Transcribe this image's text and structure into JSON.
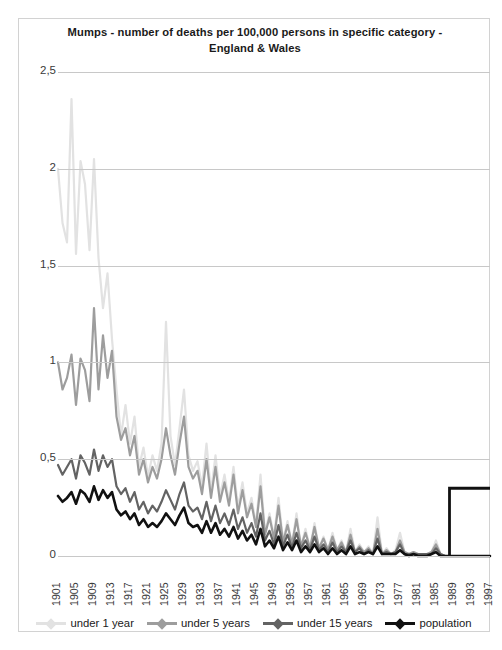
{
  "chart": {
    "title": "Mumps - number of deaths per 100,000  persons in specific category - England & Wales"
  },
  "chart_data": {
    "type": "line",
    "title": "Mumps - number of deaths per 100,000  persons in specific category - England & Wales",
    "xlabel": "",
    "ylabel": "",
    "ylim": [
      0,
      2.5
    ],
    "xlim": [
      1901,
      1997
    ],
    "grid": true,
    "legend_position": "bottom",
    "ytick_labels": [
      "0",
      "0,5",
      "1",
      "1,5",
      "2",
      "2,5"
    ],
    "ytick_values": [
      0,
      0.5,
      1,
      1.5,
      2,
      2.5
    ],
    "xtick_labels": [
      "1901",
      "1905",
      "1909",
      "1913",
      "1917",
      "1921",
      "1925",
      "1929",
      "1933",
      "1937",
      "1941",
      "1945",
      "1949",
      "1953",
      "1957",
      "1961",
      "1965",
      "1969",
      "1973",
      "1977",
      "1981",
      "1985",
      "1989",
      "1993",
      "1997"
    ],
    "colors": {
      "under_1_year": "#e2e2e2",
      "under_5_years": "#9d9d9d",
      "under_15_years": "#636363",
      "population": "#111111",
      "gridline": "#c8c8c8",
      "border": "#d2d2d2",
      "text": "#1a1a1a"
    },
    "x": [
      1901,
      1902,
      1903,
      1904,
      1905,
      1906,
      1907,
      1908,
      1909,
      1910,
      1911,
      1912,
      1913,
      1914,
      1915,
      1916,
      1917,
      1918,
      1919,
      1920,
      1921,
      1922,
      1923,
      1924,
      1925,
      1926,
      1927,
      1928,
      1929,
      1930,
      1931,
      1932,
      1933,
      1934,
      1935,
      1936,
      1937,
      1938,
      1939,
      1940,
      1941,
      1942,
      1943,
      1944,
      1945,
      1946,
      1947,
      1948,
      1949,
      1950,
      1951,
      1952,
      1953,
      1954,
      1955,
      1956,
      1957,
      1958,
      1959,
      1960,
      1961,
      1962,
      1963,
      1964,
      1965,
      1966,
      1967,
      1968,
      1969,
      1970,
      1971,
      1972,
      1973,
      1974,
      1975,
      1976,
      1977,
      1978,
      1979,
      1980,
      1981,
      1982,
      1983,
      1984,
      1985,
      1986,
      1987,
      1988,
      1989,
      1990,
      1991,
      1992,
      1993,
      1994,
      1995,
      1996,
      1997
    ],
    "series": [
      {
        "name": "under 1 year",
        "color": "#e2e2e2",
        "values": [
          2.0,
          1.72,
          1.62,
          2.36,
          1.56,
          2.04,
          1.92,
          1.58,
          2.05,
          1.54,
          1.28,
          1.46,
          1.12,
          0.86,
          0.62,
          0.78,
          0.58,
          0.72,
          0.46,
          0.56,
          0.41,
          0.52,
          0.44,
          0.58,
          1.21,
          0.62,
          0.47,
          0.66,
          0.86,
          0.52,
          0.44,
          0.49,
          0.36,
          0.58,
          0.33,
          0.52,
          0.31,
          0.42,
          0.28,
          0.46,
          0.25,
          0.38,
          0.22,
          0.3,
          0.16,
          0.42,
          0.12,
          0.22,
          0.1,
          0.3,
          0.08,
          0.18,
          0.06,
          0.22,
          0.05,
          0.14,
          0.04,
          0.17,
          0.04,
          0.1,
          0.03,
          0.12,
          0.03,
          0.08,
          0.02,
          0.14,
          0.02,
          0.06,
          0.02,
          0.05,
          0.01,
          0.2,
          0.01,
          0.04,
          0.01,
          0.03,
          0.12,
          0.02,
          0.01,
          0.02,
          0.01,
          0.01,
          0.01,
          0.02,
          0.08,
          0.01,
          0.0,
          0.0,
          0.0,
          0.0,
          0.0,
          0.0,
          0.0,
          0.0,
          0.0,
          0.0,
          0.0
        ]
      },
      {
        "name": "under 5 years",
        "color": "#9d9d9d",
        "values": [
          1.0,
          0.86,
          0.92,
          1.04,
          0.78,
          1.02,
          0.96,
          0.8,
          1.28,
          0.86,
          1.14,
          0.92,
          1.06,
          0.72,
          0.6,
          0.66,
          0.52,
          0.62,
          0.42,
          0.5,
          0.38,
          0.46,
          0.4,
          0.5,
          0.66,
          0.52,
          0.42,
          0.58,
          0.72,
          0.46,
          0.4,
          0.44,
          0.32,
          0.5,
          0.3,
          0.46,
          0.28,
          0.38,
          0.26,
          0.42,
          0.22,
          0.34,
          0.2,
          0.27,
          0.15,
          0.36,
          0.11,
          0.2,
          0.09,
          0.26,
          0.07,
          0.16,
          0.06,
          0.19,
          0.05,
          0.12,
          0.04,
          0.15,
          0.04,
          0.09,
          0.03,
          0.1,
          0.03,
          0.07,
          0.02,
          0.11,
          0.02,
          0.05,
          0.02,
          0.04,
          0.01,
          0.14,
          0.01,
          0.03,
          0.01,
          0.02,
          0.08,
          0.02,
          0.01,
          0.02,
          0.01,
          0.01,
          0.01,
          0.02,
          0.06,
          0.01,
          0.0,
          0.0,
          0.0,
          0.0,
          0.0,
          0.0,
          0.0,
          0.0,
          0.0,
          0.0,
          0.0
        ]
      },
      {
        "name": "under 15 years",
        "color": "#636363",
        "values": [
          0.47,
          0.42,
          0.46,
          0.5,
          0.4,
          0.52,
          0.48,
          0.42,
          0.55,
          0.44,
          0.52,
          0.46,
          0.5,
          0.36,
          0.32,
          0.35,
          0.28,
          0.33,
          0.24,
          0.28,
          0.22,
          0.26,
          0.23,
          0.28,
          0.34,
          0.29,
          0.24,
          0.32,
          0.38,
          0.26,
          0.23,
          0.25,
          0.19,
          0.28,
          0.18,
          0.26,
          0.17,
          0.22,
          0.16,
          0.24,
          0.14,
          0.2,
          0.12,
          0.17,
          0.1,
          0.22,
          0.08,
          0.13,
          0.06,
          0.16,
          0.05,
          0.11,
          0.04,
          0.12,
          0.04,
          0.08,
          0.03,
          0.1,
          0.03,
          0.06,
          0.02,
          0.07,
          0.02,
          0.05,
          0.02,
          0.08,
          0.02,
          0.04,
          0.01,
          0.03,
          0.01,
          0.09,
          0.01,
          0.02,
          0.01,
          0.02,
          0.06,
          0.01,
          0.01,
          0.01,
          0.01,
          0.01,
          0.01,
          0.01,
          0.04,
          0.01,
          0.0,
          0.0,
          0.0,
          0.0,
          0.0,
          0.0,
          0.0,
          0.0,
          0.0,
          0.0,
          0.0
        ]
      },
      {
        "name": "population",
        "color": "#111111",
        "values": [
          0.31,
          0.28,
          0.3,
          0.33,
          0.27,
          0.34,
          0.32,
          0.28,
          0.36,
          0.29,
          0.34,
          0.3,
          0.33,
          0.24,
          0.21,
          0.23,
          0.19,
          0.22,
          0.16,
          0.19,
          0.15,
          0.17,
          0.15,
          0.18,
          0.22,
          0.19,
          0.16,
          0.21,
          0.25,
          0.17,
          0.15,
          0.16,
          0.12,
          0.18,
          0.12,
          0.17,
          0.11,
          0.14,
          0.1,
          0.15,
          0.09,
          0.13,
          0.08,
          0.11,
          0.06,
          0.14,
          0.05,
          0.08,
          0.04,
          0.1,
          0.03,
          0.07,
          0.03,
          0.08,
          0.02,
          0.05,
          0.02,
          0.06,
          0.02,
          0.04,
          0.01,
          0.04,
          0.01,
          0.03,
          0.01,
          0.05,
          0.01,
          0.02,
          0.01,
          0.02,
          0.01,
          0.05,
          0.01,
          0.01,
          0.01,
          0.01,
          0.03,
          0.01,
          0.0,
          0.01,
          0.0,
          0.0,
          0.0,
          0.01,
          0.02,
          0.0,
          0.0,
          0.0,
          0.0,
          0.0,
          0.0,
          0.0,
          0.0,
          0.0,
          0.0,
          0.0,
          0.0
        ]
      }
    ],
    "annotations": [
      {
        "name": "vaccine-introduction-marker",
        "shape": "step",
        "color": "#111111",
        "x_start": 1988,
        "x_end": 1997,
        "y_level": 0.35
      }
    ]
  },
  "legend": {
    "items": [
      {
        "label": "under 1 year",
        "color": "#e2e2e2"
      },
      {
        "label": "under 5 years",
        "color": "#9d9d9d"
      },
      {
        "label": "under 15 years",
        "color": "#636363"
      },
      {
        "label": "population",
        "color": "#111111"
      }
    ]
  }
}
